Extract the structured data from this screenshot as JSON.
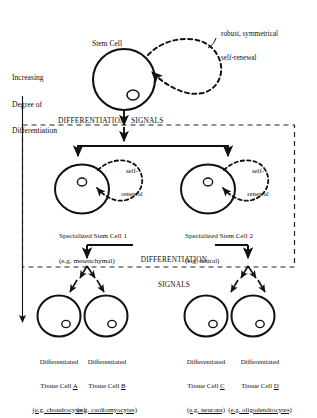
{
  "diagram": {
    "title_axis": "Increasing\nDegree of\nDifferentiation",
    "axis_line1": "Increasing",
    "axis_line2": "Degree of",
    "axis_line3": "Differentiation",
    "stem_cell_label": "Stem Cell",
    "top_annotation_line1": "robust, symmetrical",
    "top_annotation_line2": "self-renewal",
    "signals_top": "DIFFERENTIATION          SIGNALS",
    "signals_top_left": "DIFFERENTIATION",
    "signals_top_right": "SIGNALS",
    "signals_mid_line1": "DIFFERENTIATION",
    "signals_mid_line2": "SIGNALS",
    "self_renewal_left_line1": "self-",
    "self_renewal_left_line2": "renewal",
    "self_renewal_right_line1": "self-",
    "self_renewal_right_line2": "renewal",
    "specialized": [
      {
        "name": "Specialized Stem Cell 1",
        "example": "(e.g. mesenchymal)"
      },
      {
        "name": "Specialized Stem Cell 2",
        "example": "(e.g. neural)"
      }
    ],
    "differentiated": [
      {
        "line1": "Differentiated",
        "line2_prefix": "Tissue Cell ",
        "letter": "A",
        "example": "(e.g. chondrocytes)"
      },
      {
        "line1": "Differentiated",
        "line2_prefix": "Tissue Cell ",
        "letter": "B",
        "example": "(e.g. cardiomyocytes)"
      },
      {
        "line1": "Differentiated",
        "line2_prefix": "Tissue Cell ",
        "letter": "C",
        "example": "(e.g. neurons)"
      },
      {
        "line1": "Differentiated",
        "line2_prefix": "Tissue Cell ",
        "letter": "D",
        "example": "(e.g. oligodendrocytes)"
      }
    ],
    "colors": {
      "ink": "#111111",
      "background": "#ffffff",
      "dash": "#222222"
    }
  }
}
